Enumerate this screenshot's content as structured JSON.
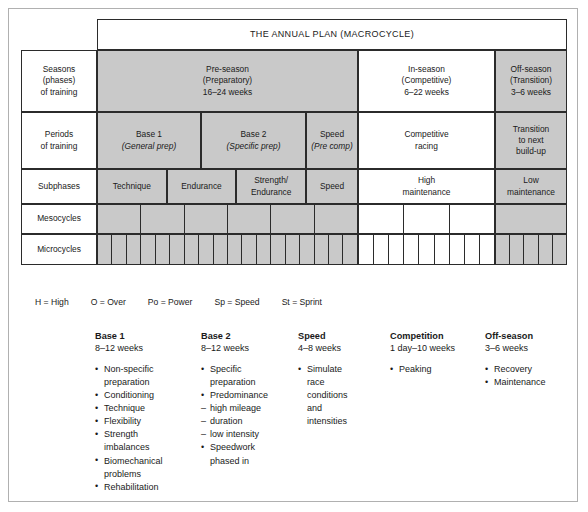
{
  "title": "THE ANNUAL PLAN (MACROCYCLE)",
  "row_labels": {
    "seasons": "Seasons\n(phases)\nof training",
    "seasons_l1": "Seasons",
    "seasons_l2": "(phases)",
    "seasons_l3": "of training",
    "periods_l1": "Periods",
    "periods_l2": "of training",
    "subphases": "Subphases",
    "mesocycles": "Mesocycles",
    "microcycles": "Microcycles"
  },
  "seasons": {
    "preseason_l1": "Pre-season",
    "preseason_l2": "(Preparatory)",
    "preseason_l3": "16–24 weeks",
    "inseason_l1": "In-season",
    "inseason_l2": "(Competitive)",
    "inseason_l3": "6–22 weeks",
    "offseason_l1": "Off-season",
    "offseason_l2": "(Transition)",
    "offseason_l3": "3–6 weeks"
  },
  "periods": {
    "base1_l1": "Base 1",
    "base1_l2": "(General prep)",
    "base2_l1": "Base 2",
    "base2_l2": "(Specific prep)",
    "speed_l1": "Speed",
    "speed_l2": "(Pre comp)",
    "racing_l1": "Competitive",
    "racing_l2": "racing",
    "transition_l1": "Transition",
    "transition_l2": "to next",
    "transition_l3": "build-up"
  },
  "subphases": {
    "technique": "Technique",
    "endurance": "Endurance",
    "strength_l1": "Strength/",
    "strength_l2": "Endurance",
    "speed": "Speed",
    "high_l1": "High",
    "high_l2": "maintenance",
    "low_l1": "Low",
    "low_l2": "maintenance"
  },
  "cycles": {
    "mesocycles_shaded_pre": 6,
    "mesocycles_white_in": 3,
    "mesocycles_shaded_off": 1,
    "microcycles_shaded_pre": 18,
    "microcycles_white_in": 9,
    "microcycles_shaded_off": 5
  },
  "legend": [
    "H = High",
    "O = Over",
    "Po = Power",
    "Sp = Speed",
    "St = Sprint"
  ],
  "columns": [
    {
      "heading": "Base 1",
      "weeks": "8–12 weeks",
      "items": [
        {
          "type": "bullet",
          "text": "Non-specific"
        },
        {
          "type": "cont",
          "text": "preparation"
        },
        {
          "type": "bullet",
          "text": "Conditioning"
        },
        {
          "type": "bullet",
          "text": "Technique"
        },
        {
          "type": "bullet",
          "text": "Flexibility"
        },
        {
          "type": "bullet",
          "text": "Strength"
        },
        {
          "type": "cont",
          "text": "imbalances"
        },
        {
          "type": "bullet",
          "text": "Biomechanical"
        },
        {
          "type": "cont",
          "text": "problems"
        },
        {
          "type": "bullet",
          "text": "Rehabilitation"
        }
      ]
    },
    {
      "heading": "Base 2",
      "weeks": "8–12 weeks",
      "items": [
        {
          "type": "bullet",
          "text": "Specific"
        },
        {
          "type": "cont",
          "text": "preparation"
        },
        {
          "type": "bullet",
          "text": "Predominance"
        },
        {
          "type": "dash",
          "text": "high mileage"
        },
        {
          "type": "dash",
          "text": "duration"
        },
        {
          "type": "dash",
          "text": "low intensity"
        },
        {
          "type": "bullet",
          "text": "Speedwork"
        },
        {
          "type": "cont",
          "text": "phased in"
        }
      ]
    },
    {
      "heading": "Speed",
      "weeks": "4–8 weeks",
      "items": [
        {
          "type": "bullet",
          "text": "Simulate"
        },
        {
          "type": "cont",
          "text": "race"
        },
        {
          "type": "cont",
          "text": "conditions"
        },
        {
          "type": "cont",
          "text": "and"
        },
        {
          "type": "cont",
          "text": "intensities"
        }
      ]
    },
    {
      "heading": "Competition",
      "weeks": "1 day–10 weeks",
      "items": [
        {
          "type": "bullet",
          "text": "Peaking"
        }
      ]
    },
    {
      "heading": "Off-season",
      "weeks": "3–6 weeks",
      "items": [
        {
          "type": "bullet",
          "text": "Recovery"
        },
        {
          "type": "bullet",
          "text": "Maintenance"
        }
      ]
    }
  ]
}
